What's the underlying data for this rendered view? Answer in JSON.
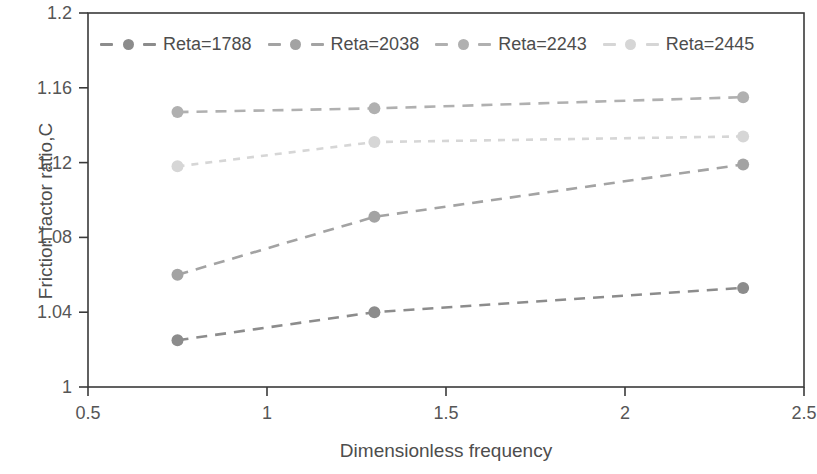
{
  "chart_data": {
    "type": "line",
    "title": "",
    "xlabel": "Dimensionless frequency",
    "ylabel": "Friction factor ratio,C",
    "xlim": [
      0.5,
      2.5
    ],
    "ylim": [
      1,
      1.2
    ],
    "xticks": [
      "0.5",
      "1",
      "1.5",
      "2",
      "2.5"
    ],
    "xtick_values": [
      0.5,
      1,
      1.5,
      2,
      2.5
    ],
    "yticks": [
      "1",
      "1.04",
      "1.08",
      "1.12",
      "1.16",
      "1.2"
    ],
    "ytick_values": [
      1,
      1.04,
      1.08,
      1.12,
      1.16,
      1.2
    ],
    "grid": false,
    "legend_position": "top-inside",
    "x": [
      0.75,
      1.3,
      2.33
    ],
    "series": [
      {
        "name": "Reta=1788",
        "values": [
          1.025,
          1.04,
          1.053
        ],
        "color": "#8c8c8c",
        "marker": "circle",
        "linestyle": "dashed"
      },
      {
        "name": "Reta=2038",
        "values": [
          1.06,
          1.091,
          1.119
        ],
        "color": "#a3a3a3",
        "marker": "circle",
        "linestyle": "dashed"
      },
      {
        "name": "Reta=2243",
        "values": [
          1.147,
          1.149,
          1.155
        ],
        "color": "#b0b0b0",
        "marker": "circle",
        "linestyle": "dashed"
      },
      {
        "name": "Reta=2445",
        "values": [
          1.118,
          1.131,
          1.134
        ],
        "color": "#d6d6d6",
        "marker": "circle",
        "linestyle": "dotted"
      }
    ],
    "axis_color": "#3a3a3a"
  }
}
